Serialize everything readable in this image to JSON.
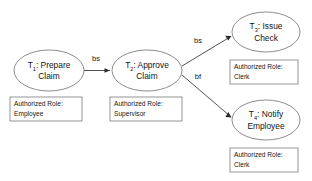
{
  "diagram": {
    "background_color": "#ffffff",
    "node_stroke_color": "#6f6f6f",
    "edge_color": "#3d3d3d",
    "text_color": "#141414",
    "nodes": [
      {
        "id": "T1",
        "label_prefix": "T",
        "label_subscript": "1",
        "label_line1": ": Prepare",
        "label_line2": "Claim",
        "role_line1": "Authorized Role:",
        "role_line2": "Employee"
      },
      {
        "id": "T2",
        "label_prefix": "T",
        "label_subscript": "2",
        "label_line1": ": Approve",
        "label_line2": "Claim",
        "role_line1": "Authorized Role:",
        "role_line2": "Supervisor"
      },
      {
        "id": "T3",
        "label_prefix": "T",
        "label_subscript": "3",
        "label_line1": ": Issue",
        "label_line2": "Check",
        "role_line1": "Authorized Role:",
        "role_line2": "Clerk"
      },
      {
        "id": "T4",
        "label_prefix": "T",
        "label_subscript": "4",
        "label_line1": ": Notify",
        "label_line2": "Employee",
        "role_line1": "Authorized Role:",
        "role_line2": "Clerk"
      }
    ],
    "edges": [
      {
        "id": "e1",
        "from": "T1",
        "to": "T2",
        "label": "bs"
      },
      {
        "id": "e2",
        "from": "T2",
        "to": "T3",
        "label": "bs"
      },
      {
        "id": "e3",
        "from": "T2",
        "to": "T4",
        "label": "bf"
      }
    ]
  }
}
